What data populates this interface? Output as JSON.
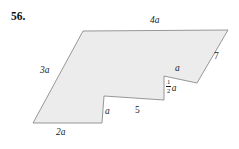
{
  "problem": {
    "number": "56."
  },
  "figure": {
    "type": "polygon-with-notch",
    "fill_color": "#ececec",
    "stroke_color": "#8c8c8c",
    "stroke_width": 0.9,
    "vertices": [
      [
        83,
        31
      ],
      [
        228,
        30
      ],
      [
        197,
        83
      ],
      [
        164,
        76
      ],
      [
        164,
        100
      ],
      [
        104,
        96
      ],
      [
        102,
        123
      ],
      [
        33,
        123
      ]
    ],
    "labels": [
      {
        "id": "top-edge",
        "text": "4a",
        "x": 150,
        "y": 17,
        "style": "italic"
      },
      {
        "id": "right-edge",
        "text": "7",
        "x": 214,
        "y": 52,
        "style": "plain"
      },
      {
        "id": "notch-top-edge",
        "text": "a",
        "x": 175,
        "y": 65,
        "style": "italic"
      },
      {
        "id": "notch-side-edge",
        "text": "",
        "x": 165,
        "y": 79,
        "style": "frac"
      },
      {
        "id": "middle-edge",
        "text": "5",
        "x": 135,
        "y": 106,
        "style": "plain"
      },
      {
        "id": "step-side-edge",
        "text": "a",
        "x": 105,
        "y": 107,
        "style": "italic"
      },
      {
        "id": "left-edge",
        "text": "3a",
        "x": 40,
        "y": 66,
        "style": "italic"
      },
      {
        "id": "bottom-edge",
        "text": "2a",
        "x": 56,
        "y": 128,
        "style": "italic"
      }
    ],
    "fraction_label": {
      "numerator": "1",
      "denominator": "2",
      "variable": "a"
    },
    "side_lengths": {
      "top": "4a",
      "right_slant": "7",
      "notch_top": "a",
      "notch_vertical": "1/2 a",
      "lower_middle": "5",
      "step_vertical": "a",
      "left_slant": "3a",
      "bottom": "2a"
    }
  }
}
